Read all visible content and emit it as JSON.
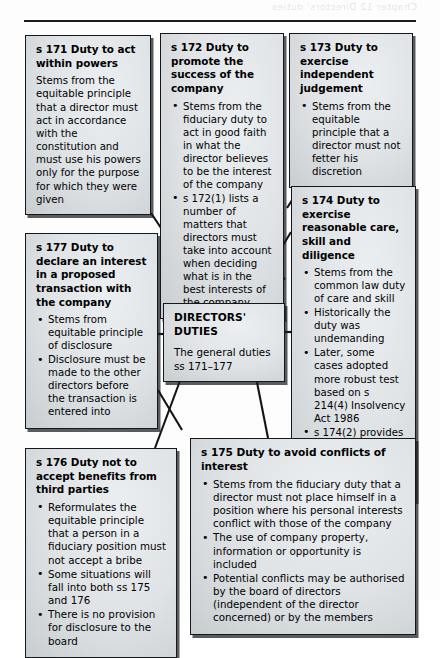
{
  "page": {
    "bleed_text": "Chapter 12 Directors' duties"
  },
  "center": {
    "title": "DIRECTORS' DUTIES",
    "body": "The general duties ss 171–177"
  },
  "nodes": [
    {
      "id": "s171",
      "title": "s 171 Duty to act within powers",
      "body_plain": "Stems from the equitable principle that a director must act in accordance with the constitution and must use his powers only for the purpose for which they were given",
      "bullets": []
    },
    {
      "id": "s172",
      "title": "s 172 Duty to promote the success of the company",
      "bullets": [
        "Stems from the fiduciary duty to act in good faith in what the director believes to be the interest of the company",
        "s 172(1) lists a number of matters that directors must take into account when deciding what is in the best interests of the company"
      ]
    },
    {
      "id": "s173",
      "title": "s 173 Duty to exercise independent judgement",
      "bullets": [
        "Stems from the equitable principle that a director must not fetter his discretion"
      ]
    },
    {
      "id": "s174",
      "title": "s 174 Duty to exercise reasonable care, skill and diligence",
      "bullets": [
        "Stems from the common law duty of care and skill",
        "Historically the duty was undemanding",
        "Later, some cases adopted more robust test based on s 214(4) Insolvency Act 1986",
        "s 174(2) provides for dual test with both objective and subjective elements"
      ]
    },
    {
      "id": "s177",
      "title": "s 177 Duty to declare an interest in a proposed transaction with the company",
      "bullets": [
        "Stems from equitable principle of disclosure",
        "Disclosure must be made to the other directors before the transaction is entered into"
      ]
    },
    {
      "id": "s176",
      "title": "s 176 Duty not to accept benefits from third parties",
      "bullets": [
        "Reformulates the equitable principle that a person in a fiduciary position must not accept a bribe",
        "Some situations will fall into both ss 175 and 176",
        "There is no provision for disclosure to the board"
      ]
    },
    {
      "id": "s175",
      "title": "s 175 Duty to avoid conflicts of interest",
      "bullets": [
        "Stems from the fiduciary duty that a director must not place himself in a position where his personal interests conflict with those of the company",
        "The use of company property, information or opportunity is included",
        "Potential conflicts may be authorised by the board of directors (independent of the director concerned) or by the members"
      ]
    }
  ],
  "colors": {
    "box_fill_light": "#eceff1",
    "box_fill_dark": "#b6bcc0",
    "border": "#14181c",
    "connector": "#141414",
    "page_background": "#fdfdfd"
  }
}
